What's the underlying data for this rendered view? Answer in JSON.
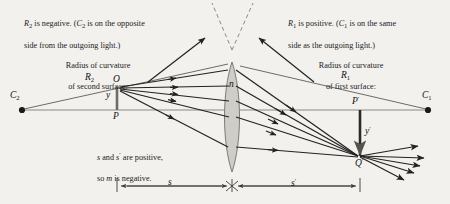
{
  "figure": {
    "colors": {
      "background": "#f2f1ee",
      "ray": "#222222",
      "axis": "#8a8a8a",
      "lens_fill": "#cfcdc7",
      "lens_stroke": "#7d7b75",
      "dashed": "#8c8a84",
      "dimension": "#3a3a3a",
      "text": "#1b1b1b"
    }
  },
  "captions": {
    "top_left": "R₂ is negative. (C₂ is on the opposite\nside from the outgoing light.)",
    "top_left_html": "<i>R</i><sub>2</sub> is negative. (<i>C</i><sub>2</sub> is on the opposite\nside from the outgoing light.)",
    "top_right": "R₁ is positive. (C₁ is on the same\nside as the outgoing light.)",
    "radius_second": "Radius of curvature\nof second surface:",
    "radius_first": "Radius of curvature\nof first surface:",
    "sign_note": "s and s′ are positive,\nso m is negative."
  },
  "labels": {
    "c2": "C",
    "c2_sub": "2",
    "c1": "C",
    "c1_sub": "1",
    "r2": "R",
    "r2_sub": "2",
    "r1": "R",
    "r1_sub": "1",
    "object_point": "Q",
    "object_foot": "P",
    "object_height": "y",
    "image_point": "Q",
    "image_point_prime": "′",
    "image_foot": "P",
    "image_foot_prime": "′",
    "image_height": "y",
    "image_height_prime": "′",
    "index": "n",
    "object_distance": "s",
    "image_distance": "s",
    "image_distance_prime": "′"
  },
  "geometry": {
    "axis_y": 110,
    "lens_center_x": 232,
    "lens_top_y": 62,
    "lens_bottom_y": 172,
    "c2_x": 22,
    "c1_x": 428,
    "object_x": 117,
    "object_top_y": 86,
    "image_x": 360,
    "image_bottom_y": 160,
    "dimension_y": 186
  }
}
